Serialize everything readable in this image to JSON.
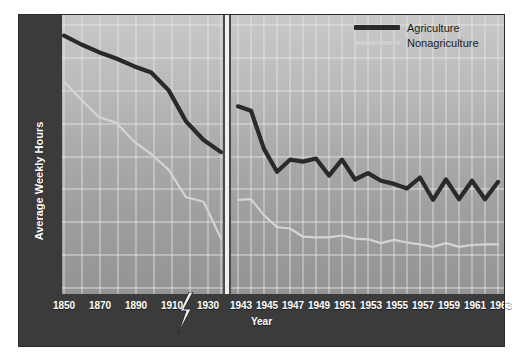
{
  "chart_data": {
    "type": "line",
    "title": "",
    "xlabel": "Year",
    "ylabel": "Average Weekly Hours",
    "ylim": [
      33,
      77
    ],
    "yticks": [
      75,
      70,
      65,
      60,
      55,
      50,
      45,
      40,
      35
    ],
    "grid": true,
    "legend_position": "top-right",
    "axis_break": {
      "present": true,
      "symbol": "lightning-bolt",
      "between": [
        "1930",
        "1943"
      ],
      "note": "x-axis scale changes from 20-year intervals to 1-year intervals"
    },
    "x_tick_labels": [
      "1850",
      "1870",
      "1890",
      "1910",
      "1930",
      "1943",
      "1945",
      "1947",
      "1949",
      "1951",
      "1953",
      "1955",
      "1957",
      "1959",
      "1961",
      "1963"
    ],
    "segments": [
      {
        "name": "pre-war",
        "x": [
          1850,
          1860,
          1870,
          1880,
          1890,
          1900,
          1910,
          1920,
          1930,
          1940
        ],
        "series": [
          {
            "name": "Agriculture",
            "values": [
              73.6,
              72.2,
              71.0,
              70.0,
              68.8,
              67.8,
              65.0,
              60.1,
              57.2,
              55.3
            ]
          },
          {
            "name": "Nonagriculture",
            "values": [
              66.4,
              63.5,
              60.8,
              59.9,
              57.0,
              55.0,
              52.5,
              48.2,
              47.5,
              41.7
            ]
          }
        ]
      },
      {
        "name": "post-war",
        "x": [
          1943,
          1944,
          1945,
          1946,
          1947,
          1948,
          1949,
          1950,
          1951,
          1952,
          1953,
          1954,
          1955,
          1956,
          1957,
          1958,
          1959,
          1960,
          1961,
          1962,
          1963
        ],
        "series": [
          {
            "name": "Agriculture",
            "values": [
              62.5,
              61.8,
              55.8,
              52.2,
              54.1,
              53.8,
              54.3,
              51.6,
              54.1,
              51.0,
              52.0,
              50.8,
              50.3,
              49.6,
              51.3,
              47.8,
              51.0,
              47.9,
              50.8,
              47.9,
              50.6
            ]
          },
          {
            "name": "Nonagriculture",
            "values": [
              47.8,
              47.9,
              45.4,
              43.5,
              43.3,
              42.0,
              41.9,
              41.9,
              42.2,
              41.7,
              41.6,
              41.0,
              41.5,
              41.1,
              40.8,
              40.4,
              41.0,
              40.4,
              40.7,
              40.8,
              40.8
            ]
          }
        ]
      }
    ],
    "series_styles": [
      {
        "name": "Agriculture",
        "color": "#2a2a2a",
        "width": 4.2
      },
      {
        "name": "Nonagriculture",
        "color": "#d4d4d4",
        "width": 2.2
      }
    ]
  },
  "legend": {
    "items": [
      {
        "label": "Agriculture",
        "color": "#2a2a2a"
      },
      {
        "label": "Nonagriculture",
        "color": "#d0d0d0"
      }
    ]
  },
  "axes": {
    "y_title": "Average Weekly Hours",
    "x_title": "Year",
    "y_ticks": [
      "75",
      "70",
      "65",
      "60",
      "55",
      "50",
      "45",
      "40",
      "35"
    ],
    "x_ticks": [
      "1850",
      "1870",
      "1890",
      "1910",
      "1930",
      "1943",
      "1945",
      "1947",
      "1949",
      "1951",
      "1953",
      "1955",
      "1957",
      "1959",
      "1961",
      "1963"
    ]
  },
  "colors": {
    "agriculture": "#2a2a2a",
    "nonagriculture": "#d0d0d0",
    "axis_band": "#3b3b3b",
    "grid": "#e8e8e8",
    "panel_top": "#c9c9c9",
    "panel_bottom": "#949494"
  }
}
